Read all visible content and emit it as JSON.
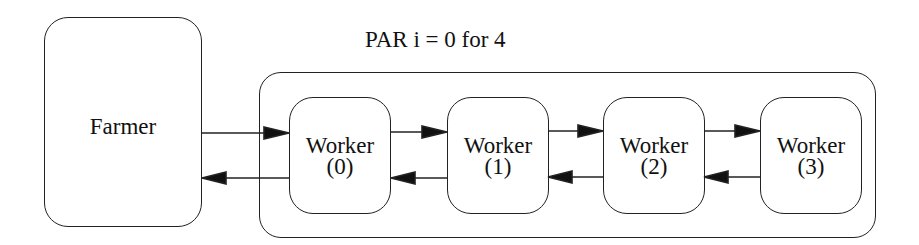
{
  "title": "PAR i = 0 for 4",
  "farmer": {
    "label": "Farmer"
  },
  "workers": [
    {
      "name": "Worker",
      "index": "(0)"
    },
    {
      "name": "Worker",
      "index": "(1)"
    },
    {
      "name": "Worker",
      "index": "(2)"
    },
    {
      "name": "Worker",
      "index": "(3)"
    }
  ],
  "edges": [
    {
      "from": "Farmer",
      "to": "Worker (0)"
    },
    {
      "from": "Worker (0)",
      "to": "Farmer"
    },
    {
      "from": "Worker (0)",
      "to": "Worker (1)"
    },
    {
      "from": "Worker (1)",
      "to": "Worker (0)"
    },
    {
      "from": "Worker (1)",
      "to": "Worker (2)"
    },
    {
      "from": "Worker (2)",
      "to": "Worker (1)"
    },
    {
      "from": "Worker (2)",
      "to": "Worker (3)"
    },
    {
      "from": "Worker (3)",
      "to": "Worker (2)"
    }
  ]
}
